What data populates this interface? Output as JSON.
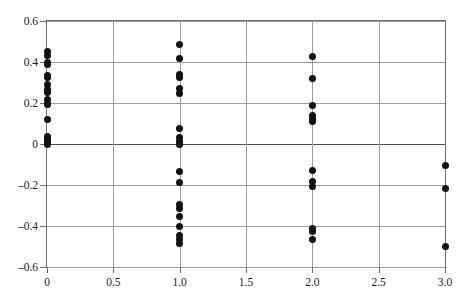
{
  "chart_data": {
    "type": "scatter",
    "title": "",
    "subtitle": "",
    "xlabel": "",
    "ylabel": "",
    "xlim": [
      0,
      3
    ],
    "ylim": [
      -0.6,
      0.6
    ],
    "xticks": [
      0,
      0.5,
      1.0,
      1.5,
      2.0,
      2.5,
      3.0
    ],
    "xtick_labels": [
      "0",
      "0.5",
      "1.0",
      "1.5",
      "2.0",
      "2.5",
      "3.0"
    ],
    "yticks": [
      0.6,
      0.4,
      0.2,
      0,
      -0.2,
      -0.4,
      -0.6
    ],
    "ytick_labels": [
      "0.6",
      "0.4",
      "0.2",
      "0",
      "–0.2",
      "–0.4",
      "–0.6"
    ],
    "grid": true,
    "grid_axis": "both",
    "legend": false,
    "legend_position": "none",
    "marker": "filled-circle",
    "marker_color": "#111111",
    "marker_size": 7,
    "grid_color": "#9a9a9a",
    "frame_color": "#6f6f6f",
    "background_color": "#ffffff",
    "annotations": [],
    "series": [
      {
        "name": "observations",
        "x": [
          0,
          0,
          0,
          0,
          0,
          0,
          0,
          0,
          0,
          0,
          0,
          0,
          0,
          0,
          0,
          0,
          0,
          1,
          1,
          1,
          1,
          1,
          1,
          1,
          1,
          1,
          1,
          1,
          1,
          1,
          1,
          1,
          1,
          1,
          1,
          1,
          2,
          2,
          2,
          2,
          2,
          2,
          2,
          2,
          2,
          2,
          2,
          2,
          3,
          3,
          3
        ],
        "y": [
          0.45,
          0.43,
          0.4,
          0.39,
          0.335,
          0.325,
          0.29,
          0.265,
          0.25,
          0.215,
          0.2,
          0.195,
          0.12,
          0.035,
          0.02,
          0.005,
          0.0,
          0.485,
          0.415,
          0.34,
          0.325,
          0.27,
          0.245,
          0.075,
          0.03,
          0.01,
          0.0,
          -0.135,
          -0.19,
          -0.295,
          -0.315,
          -0.355,
          -0.4,
          -0.445,
          -0.465,
          -0.485,
          0.425,
          0.32,
          0.19,
          0.14,
          0.125,
          0.11,
          -0.13,
          -0.185,
          -0.205,
          -0.41,
          -0.425,
          -0.465,
          -0.105,
          -0.215,
          -0.5
        ]
      }
    ],
    "groups": [
      {
        "x": 0,
        "count": 17,
        "min": 0.0,
        "max": 0.45
      },
      {
        "x": 1,
        "count": 19,
        "min": -0.485,
        "max": 0.485
      },
      {
        "x": 2,
        "count": 12,
        "min": -0.465,
        "max": 0.425
      },
      {
        "x": 3,
        "count": 3,
        "min": -0.5,
        "max": -0.105
      }
    ]
  }
}
